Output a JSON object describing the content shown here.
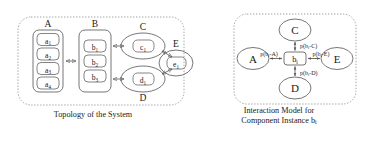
{
  "figure": {
    "background": "#ffffff",
    "stroke": "#555555",
    "text_color": "#1a1a1a"
  },
  "left_panel": {
    "caption": "Topology of the System",
    "container_label": "system-topology-dotted-box",
    "groups": [
      {
        "id": "A",
        "label": "A",
        "shape": "rounded-rect",
        "members": [
          {
            "id": "a1",
            "base": "a",
            "sub": "1"
          },
          {
            "id": "a2",
            "base": "a",
            "sub": "2"
          },
          {
            "id": "a3",
            "base": "a",
            "sub": "3"
          },
          {
            "id": "a4",
            "base": "a",
            "sub": "4"
          }
        ]
      },
      {
        "id": "B",
        "label": "B",
        "shape": "rounded-rect",
        "members": [
          {
            "id": "b1",
            "base": "b",
            "sub": "1"
          },
          {
            "id": "b2",
            "base": "b",
            "sub": "2"
          },
          {
            "id": "b3",
            "base": "b",
            "sub": "3"
          }
        ]
      },
      {
        "id": "C",
        "label": "C",
        "shape": "ellipse",
        "members": [
          {
            "id": "c1",
            "base": "c",
            "sub": "1"
          }
        ]
      },
      {
        "id": "D",
        "label": "D",
        "shape": "ellipse",
        "members": [
          {
            "id": "d1",
            "base": "d",
            "sub": "1"
          }
        ]
      },
      {
        "id": "E",
        "label": "E",
        "shape": "ellipse",
        "members": [
          {
            "id": "e1",
            "base": "e",
            "sub": "1"
          }
        ]
      }
    ],
    "connections": [
      {
        "from": "A",
        "to": "B",
        "type": "double-arrow"
      },
      {
        "from": "B",
        "to": "C",
        "type": "double-arrow"
      },
      {
        "from": "B",
        "to": "D",
        "type": "double-arrow"
      },
      {
        "from": "C",
        "to": "E",
        "type": "double-arrow"
      },
      {
        "from": "D",
        "to": "E",
        "type": "double-arrow"
      }
    ]
  },
  "right_panel": {
    "caption_line1": "Interaction Model for",
    "caption_line2_prefix": "Component Instance b",
    "caption_line2_sub": "i",
    "container_label": "interaction-model-dotted-box",
    "center_node": {
      "id": "bi",
      "base": "b",
      "sub": "i",
      "shape": "rounded-rect"
    },
    "peripheral_nodes": [
      {
        "id": "C",
        "label": "C",
        "position": "top",
        "shape": "ellipse"
      },
      {
        "id": "A",
        "label": "A",
        "position": "left",
        "shape": "ellipse"
      },
      {
        "id": "E",
        "label": "E",
        "position": "right",
        "shape": "ellipse"
      },
      {
        "id": "D",
        "label": "D",
        "position": "bottom",
        "shape": "ellipse"
      }
    ],
    "edges": [
      {
        "id": "edge-bi-C",
        "target": "C",
        "label_prefix": "p(b",
        "label_sub": "i",
        "label_suffix": "-C)",
        "full_label": "p(bi-C)",
        "position": "top"
      },
      {
        "id": "edge-bi-A",
        "target": "A",
        "label_prefix": "p(b",
        "label_sub": "i",
        "label_suffix": "-A)",
        "full_label": "p(bi-A)",
        "position": "left"
      },
      {
        "id": "edge-bi-E",
        "target": "E",
        "label_prefix": "p(b",
        "label_sub": "i",
        "label_suffix": "-E)",
        "full_label": "p(bi-E)",
        "position": "right"
      },
      {
        "id": "edge-bi-D",
        "target": "D",
        "label_prefix": "p(b",
        "label_sub": "i",
        "label_suffix": "-D)",
        "full_label": "p(bi-D)",
        "position": "bottom"
      }
    ]
  }
}
